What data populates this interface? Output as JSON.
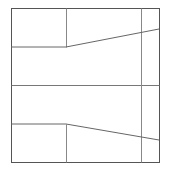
{
  "diagram": {
    "frame": {
      "x1": 11,
      "y1": 8,
      "x2": 159,
      "y2": 162,
      "color": "#555555"
    },
    "grid_lines": [
      {
        "x1": 11,
        "y1": 85,
        "x2": 159,
        "y2": 85,
        "color": "#777777"
      },
      {
        "x1": 66,
        "y1": 8,
        "x2": 66,
        "y2": 47,
        "color": "#888888"
      },
      {
        "x1": 66,
        "y1": 124,
        "x2": 66,
        "y2": 162,
        "color": "#888888"
      },
      {
        "x1": 141,
        "y1": 8,
        "x2": 141,
        "y2": 162,
        "color": "#888888"
      }
    ],
    "paths": [
      {
        "points": "11,47 66,47 159,29",
        "color": "#666666"
      },
      {
        "points": "11,124 66,124 159,140",
        "color": "#666666"
      }
    ]
  }
}
